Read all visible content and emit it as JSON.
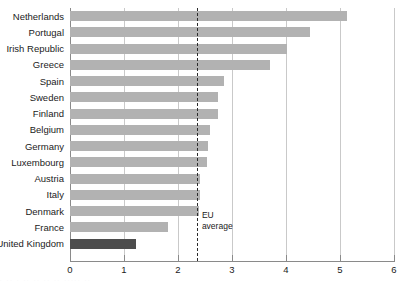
{
  "chart_data": {
    "type": "bar",
    "orientation": "horizontal",
    "title": "",
    "xlabel": "",
    "ylabel": "",
    "xlim": [
      0,
      6
    ],
    "xticks": [
      0,
      1,
      2,
      3,
      4,
      5,
      6
    ],
    "xtick_labels": [
      "0",
      "1",
      "2",
      "3",
      "4",
      "5",
      "6"
    ],
    "grid": true,
    "grid_axis": "x",
    "legend": false,
    "categories": [
      "Netherlands",
      "Portugal",
      "Irish Republic",
      "Greece",
      "Spain",
      "Sweden",
      "Finland",
      "Belgium",
      "Germany",
      "Luxembourg",
      "Austria",
      "Italy",
      "Denmark",
      "France",
      "United Kingdom"
    ],
    "values": [
      5.13,
      4.45,
      4.02,
      3.7,
      2.85,
      2.74,
      2.74,
      2.6,
      2.55,
      2.54,
      2.4,
      2.4,
      2.38,
      1.81,
      1.22
    ],
    "highlight_category": "United Kingdom",
    "colors": {
      "bar": "#b2b2b2",
      "bar_highlight": "#4d4d4d",
      "gridline": "#c9c9c9",
      "axis": "#8a8a8a",
      "annotation_line": "#2b2b2b",
      "text": "#1b1b1b"
    },
    "annotations": [
      {
        "name": "eu-average",
        "label_line1": "EU",
        "label_line2": "average",
        "value": 2.35,
        "style": "dashed-vertical-line"
      }
    ]
  }
}
